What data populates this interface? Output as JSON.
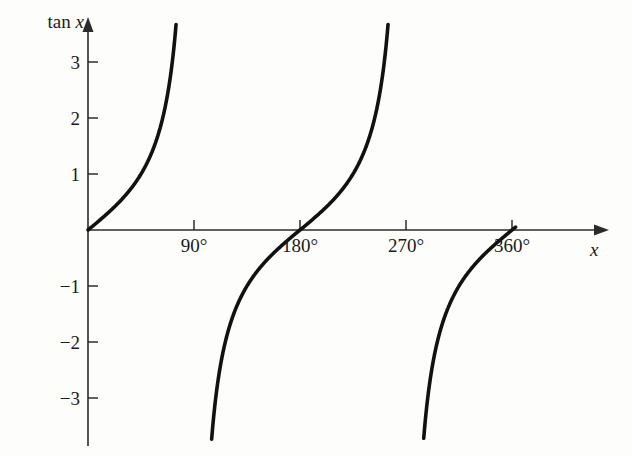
{
  "chart_data": {
    "type": "line",
    "title": "",
    "function": "tan x",
    "xlabel": "x",
    "ylabel": "tan x",
    "grid": false,
    "legend": null,
    "xunit": "degrees",
    "xlim": [
      0,
      390
    ],
    "ylim": [
      -3.7,
      3.67
    ],
    "x_tick_labels": [
      "90°",
      "180°",
      "270°",
      "360°"
    ],
    "x_tick_values": [
      90,
      180,
      270,
      360
    ],
    "y_tick_labels": [
      "3",
      "2",
      "1",
      "−1",
      "−2",
      "−3"
    ],
    "y_tick_values": [
      3,
      2,
      1,
      -1,
      -2,
      -3
    ],
    "zero_label_shown": false,
    "asymptotes_deg": [
      90,
      270
    ],
    "x_intercepts_deg": [
      0,
      180,
      360
    ],
    "branches": [
      {
        "name": "branch-0-to-90",
        "x_range_deg": [
          0,
          88.4
        ],
        "points": [
          {
            "x": 0,
            "y": 0
          },
          {
            "x": 10,
            "y": 0.176
          },
          {
            "x": 20,
            "y": 0.364
          },
          {
            "x": 30,
            "y": 0.577
          },
          {
            "x": 40,
            "y": 0.839
          },
          {
            "x": 50,
            "y": 1.192
          },
          {
            "x": 60,
            "y": 1.732
          },
          {
            "x": 70,
            "y": 2.747
          },
          {
            "x": 75,
            "y": 3.732
          }
        ]
      },
      {
        "name": "branch-90-to-270",
        "x_range_deg": [
          91.6,
          268.4
        ],
        "points": [
          {
            "x": 105,
            "y": -3.732
          },
          {
            "x": 110,
            "y": -2.747
          },
          {
            "x": 120,
            "y": -1.732
          },
          {
            "x": 135,
            "y": -1.0
          },
          {
            "x": 150,
            "y": -0.577
          },
          {
            "x": 165,
            "y": -0.268
          },
          {
            "x": 180,
            "y": 0
          },
          {
            "x": 195,
            "y": 0.268
          },
          {
            "x": 210,
            "y": 0.577
          },
          {
            "x": 225,
            "y": 1.0
          },
          {
            "x": 240,
            "y": 1.732
          },
          {
            "x": 250,
            "y": 2.747
          },
          {
            "x": 255,
            "y": 3.732
          }
        ]
      },
      {
        "name": "branch-270-to-360",
        "x_range_deg": [
          271.6,
          363.0
        ],
        "points": [
          {
            "x": 285,
            "y": -3.732
          },
          {
            "x": 290,
            "y": -2.747
          },
          {
            "x": 300,
            "y": -1.732
          },
          {
            "x": 315,
            "y": -1.0
          },
          {
            "x": 330,
            "y": -0.577
          },
          {
            "x": 345,
            "y": -0.268
          },
          {
            "x": 360,
            "y": 0
          },
          {
            "x": 363,
            "y": 0.052
          }
        ]
      }
    ],
    "colors": {
      "curve": "#111111",
      "axis": "#2b2b2b",
      "text": "#1a1a1a",
      "background": "#fdfdfc"
    }
  },
  "axes": {
    "y_title_prefix": "tan ",
    "y_title_var": "x",
    "x_title": "x"
  },
  "y_ticks": [
    {
      "label": "3",
      "value": 3
    },
    {
      "label": "2",
      "value": 2
    },
    {
      "label": "1",
      "value": 1
    },
    {
      "label": "−1",
      "value": -1
    },
    {
      "label": "−2",
      "value": -2
    },
    {
      "label": "−3",
      "value": -3
    }
  ],
  "x_ticks": [
    {
      "label": "90°",
      "value": 90
    },
    {
      "label": "180°",
      "value": 180
    },
    {
      "label": "270°",
      "value": 270
    },
    {
      "label": "360°",
      "value": 360
    }
  ]
}
